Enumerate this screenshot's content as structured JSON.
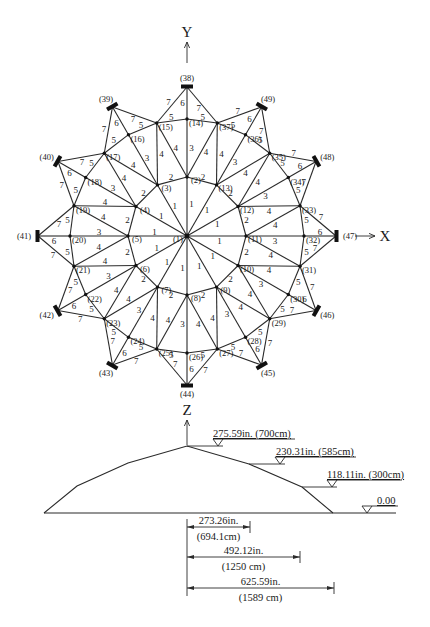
{
  "plan_view": {
    "center": [
      187,
      236
    ],
    "axes": {
      "y": {
        "label": "Y",
        "label_pos": [
          187,
          32
        ],
        "arrow_from": [
          187,
          63
        ],
        "arrow_to": [
          187,
          42
        ]
      },
      "x": {
        "label": "X",
        "label_pos": [
          385,
          236
        ],
        "arrow_from": [
          355,
          236
        ],
        "arrow_to": [
          375,
          236
        ]
      },
      "z": {
        "label": "Z",
        "label_pos": [
          187,
          410
        ],
        "arrow_from": [
          187,
          445
        ],
        "arrow_to": [
          187,
          420
        ]
      }
    },
    "rings": [
      {
        "name": "center",
        "first_node": 1,
        "count": 1,
        "radius": 0,
        "start_angle": 90,
        "step": 0
      },
      {
        "name": "inner-ring",
        "first_node": 2,
        "count": 12,
        "radius": 59,
        "start_angle": 90,
        "step": 30
      },
      {
        "name": "outer-ring",
        "first_node": 14,
        "count": 24,
        "radius": 117,
        "start_angle": 90,
        "step": 15
      },
      {
        "name": "supports",
        "first_node": 38,
        "count": 12,
        "radius": 149,
        "start_angle": 90,
        "step": 30
      }
    ],
    "member_types": {
      "1": "center to inner ring",
      "2": "inner ring chord",
      "3": "inner to outer radial",
      "4": "inner to outer diagonal",
      "5": "outer ring chord",
      "6": "support radial",
      "7": "support diagonal"
    },
    "label_offsets": {
      "1": [
        0,
        0
      ],
      "2": [
        0,
        0
      ],
      "3": [
        0,
        0
      ],
      "4": [
        0,
        0
      ],
      "5": [
        0,
        0
      ],
      "6": [
        0,
        0
      ],
      "7": [
        0,
        0
      ]
    }
  },
  "elevation": {
    "profile_points": [
      [
        44,
        513
      ],
      [
        77,
        486
      ],
      [
        128,
        463
      ],
      [
        187,
        446
      ],
      [
        249,
        464
      ],
      [
        302,
        487
      ],
      [
        333,
        513
      ]
    ],
    "baseline": {
      "from": [
        44,
        513
      ],
      "to": [
        396,
        513
      ]
    },
    "levels": [
      {
        "value": "275.59in. (700cm)",
        "leader_from": [
          187,
          446
        ],
        "marker_x": 218,
        "y": 446,
        "text_x": 213,
        "text_end": 295
      },
      {
        "value": "230.31in. (585cm)",
        "leader_from": [
          249,
          464
        ],
        "marker_x": 280,
        "y": 464,
        "text_x": 276,
        "text_end": 356
      },
      {
        "value": "118.11in. (300cm)",
        "leader_from": [
          302,
          487
        ],
        "marker_x": 332,
        "y": 487,
        "text_x": 327,
        "text_end": 402
      },
      {
        "value": "0.00",
        "leader_from": [
          396,
          513
        ],
        "marker_x": 367,
        "y": 513,
        "text_x": 377,
        "text_end": 398
      }
    ],
    "dimensions": [
      {
        "inches": "273.26in.",
        "cm": "(694.1cm)",
        "x_end": 250,
        "y": 527
      },
      {
        "inches": "492.12in.",
        "cm": "(1250 cm)",
        "x_end": 300,
        "y": 557
      },
      {
        "inches": "625.59in.",
        "cm": "(1589 cm)",
        "x_end": 334,
        "y": 588
      }
    ],
    "dimension_origin_x": 187,
    "dimension_ref_line": {
      "y_top": 519,
      "y_bottom": 596
    }
  }
}
